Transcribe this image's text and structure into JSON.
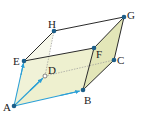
{
  "diagram": {
    "type": "parallelepiped",
    "colors": {
      "face_fill": "#eef0cf",
      "face_fill_dark": "#e3e6b8",
      "edge": "#2b2b2b",
      "hidden_edge": "#8a8a8a",
      "vector": "#2a9fd6",
      "vertex": "#1d5f8a"
    },
    "vertices": {
      "A": {
        "label": "A",
        "x": 14,
        "y": 106
      },
      "B": {
        "label": "B",
        "x": 83,
        "y": 90
      },
      "C": {
        "label": "C",
        "x": 114,
        "y": 60
      },
      "D": {
        "label": "D",
        "x": 45,
        "y": 76
      },
      "E": {
        "label": "E",
        "x": 24,
        "y": 61
      },
      "F": {
        "label": "F",
        "x": 94,
        "y": 48
      },
      "G": {
        "label": "G",
        "x": 124,
        "y": 17
      },
      "H": {
        "label": "H",
        "x": 54,
        "y": 31
      }
    },
    "vectors": [
      "AB",
      "AD",
      "AE"
    ],
    "hidden_edges": [
      "AD",
      "DC",
      "DH"
    ]
  }
}
